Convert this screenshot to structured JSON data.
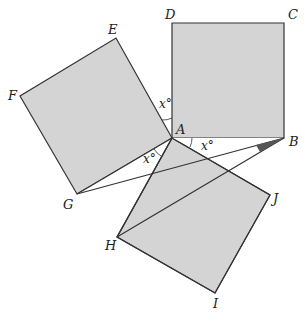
{
  "diagram": {
    "colors": {
      "fill": "#d4d4d4",
      "stroke": "#333333",
      "wedge": "#555555",
      "background": "#ffffff"
    },
    "points": {
      "A": [
        172,
        138
      ],
      "B": [
        284,
        138
      ],
      "C": [
        284,
        23
      ],
      "D": [
        172,
        23
      ],
      "E": [
        116,
        38
      ],
      "F": [
        20,
        96
      ],
      "G": [
        77,
        194
      ],
      "H": [
        117,
        237
      ],
      "I": [
        215,
        293
      ],
      "J": [
        270,
        195
      ]
    },
    "labels": {
      "A": "A",
      "B": "B",
      "C": "C",
      "D": "D",
      "E": "E",
      "F": "F",
      "G": "G",
      "H": "H",
      "I": "I",
      "J": "J"
    },
    "angle_labels": {
      "top": "x°",
      "right": "x°",
      "left": "x°"
    }
  }
}
